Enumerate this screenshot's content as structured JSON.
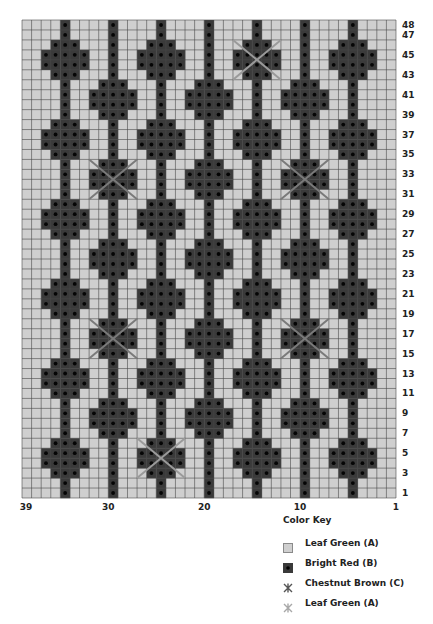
{
  "chart_data": {
    "type": "chart-grid",
    "columns": 39,
    "rows": 48,
    "column_numbering": "right-to-left",
    "row_numbering": "bottom-to-top",
    "x_tick_labels": [
      "39",
      "30",
      "20",
      "10",
      "1"
    ],
    "x_tick_columns": [
      39,
      30,
      20,
      10,
      1
    ],
    "y_tick_labels": [
      "48",
      "47",
      "45",
      "43",
      "41",
      "39",
      "37",
      "35",
      "33",
      "31",
      "29",
      "27",
      "25",
      "23",
      "21",
      "19",
      "17",
      "15",
      "13",
      "11",
      "9",
      "7",
      "5",
      "3",
      "1"
    ],
    "colors": {
      "A": "#cfcfcf",
      "B": "#3a3a3a",
      "grid": "#4a4a4a",
      "dot": "#050505",
      "cross_C": "#7a7a7a",
      "cross_A": "#9a9a9a"
    },
    "stripe_columns": [
      35,
      30,
      25,
      20,
      15,
      10,
      5
    ],
    "motif": {
      "name": "diamond",
      "shape_widths": [
        3,
        5,
        5,
        3
      ],
      "group_A_columns": [
        35,
        25,
        15,
        5
      ],
      "group_A_top_rows": [
        46,
        38,
        30,
        22,
        14,
        6
      ],
      "group_B_columns": [
        30,
        20,
        10
      ],
      "group_B_top_rows": [
        42,
        34,
        26,
        18,
        10
      ]
    },
    "crosses": [
      {
        "center_column": 15,
        "top_row": 46,
        "color_key": "A"
      },
      {
        "center_column": 30,
        "top_row": 34,
        "color_key": "C"
      },
      {
        "center_column": 10,
        "top_row": 34,
        "color_key": "C"
      },
      {
        "center_column": 30,
        "top_row": 18,
        "color_key": "C"
      },
      {
        "center_column": 10,
        "top_row": 18,
        "color_key": "C"
      },
      {
        "center_column": 25,
        "top_row": 6,
        "color_key": "A"
      }
    ]
  },
  "key": {
    "title": "Color Key",
    "items": [
      {
        "icon": "light-square",
        "label": "Leaf Green (A)"
      },
      {
        "icon": "dark-dot-square",
        "label": "Bright Red (B)"
      },
      {
        "icon": "dark-cross",
        "label": "Chestnut Brown (C)"
      },
      {
        "icon": "light-cross",
        "label": "Leaf Green (A)"
      }
    ]
  }
}
